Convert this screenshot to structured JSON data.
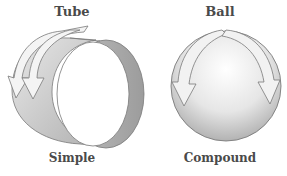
{
  "figures": [
    {
      "id": "tube",
      "title": "Tube",
      "caption": "Simple",
      "description": "cylindrical band with curved arrows wrapping around it"
    },
    {
      "id": "ball",
      "title": "Ball",
      "caption": "Compound",
      "description": "sphere with curved arrows wrapping over its top"
    }
  ],
  "colors": {
    "text": "#4a4a4a",
    "outline": "#7a7a7a",
    "tube_inner": "#a8a8a8",
    "ball_fill_light": "#f6f6f6",
    "ball_fill_dark": "#b4b4b4",
    "arrow_fill": "#f4f4f4"
  },
  "icons": [
    "curved-arrow-icon"
  ]
}
